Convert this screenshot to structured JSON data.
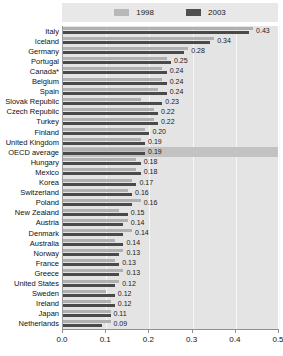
{
  "legend": {
    "entries": [
      {
        "label": "1998",
        "color": "#b8b8b8"
      },
      {
        "label": "2003",
        "color": "#4f4f4f"
      }
    ]
  },
  "axis": {
    "tick_labels": [
      "0.0",
      "0.1",
      "0.2",
      "0.3",
      "0.4",
      "0.5"
    ]
  },
  "chart_data": {
    "type": "bar",
    "orientation": "horizontal",
    "title": "",
    "subtitle": "",
    "xlabel": "",
    "ylabel": "",
    "xlim": [
      0.0,
      0.5
    ],
    "xticks": [
      0.0,
      0.1,
      0.2,
      0.3,
      0.4,
      0.5
    ],
    "grid": true,
    "legend_position": "top",
    "highlight_category": "OECD average",
    "categories": [
      "Italy",
      "Iceland",
      "Germany",
      "Portugal",
      "Canada*",
      "Belgium",
      "Spain",
      "Slovak Republic",
      "Czech Republic",
      "Turkey",
      "Finland",
      "United Kingdom",
      "OECD average",
      "Hungary",
      "Mexico",
      "Korea",
      "Switzerland",
      "Poland",
      "New Zealand",
      "Austria",
      "Denmark",
      "Australia",
      "Norway",
      "France",
      "Greece",
      "United States",
      "Sweden",
      "Ireland",
      "Japan",
      "Netherlands"
    ],
    "series": [
      {
        "name": "1998",
        "color": "#b0b0b0",
        "values": [
          0.44,
          0.35,
          0.29,
          0.24,
          0.23,
          0.23,
          0.22,
          0.18,
          0.21,
          0.21,
          0.19,
          0.18,
          0.19,
          0.17,
          0.17,
          0.16,
          0.15,
          0.18,
          0.13,
          0.15,
          0.16,
          0.12,
          0.14,
          0.12,
          0.14,
          0.13,
          0.1,
          0.11,
          0.11,
          0.11
        ]
      },
      {
        "name": "2003",
        "color": "#4a4a4a",
        "values": [
          0.43,
          0.34,
          0.28,
          0.25,
          0.24,
          0.24,
          0.24,
          0.23,
          0.22,
          0.22,
          0.2,
          0.19,
          0.19,
          0.18,
          0.18,
          0.17,
          0.16,
          0.16,
          0.15,
          0.14,
          0.14,
          0.14,
          0.13,
          0.13,
          0.13,
          0.12,
          0.12,
          0.12,
          0.11,
          0.09
        ]
      }
    ],
    "data_labels": [
      "0.43",
      "0.34",
      "0.28",
      "0.25",
      "0.24",
      "0.24",
      "0.24",
      "0.23",
      "0.22",
      "0.22",
      "0.20",
      "0.19",
      "0.19",
      "0.18",
      "0.18",
      "0.17",
      "0.16",
      "0.16",
      "0.15",
      "0.14",
      "0.14",
      "0.14",
      "0.13",
      "0.13",
      "0.13",
      "0.12",
      "0.12",
      "0.12",
      "0.11",
      "0.09"
    ]
  }
}
